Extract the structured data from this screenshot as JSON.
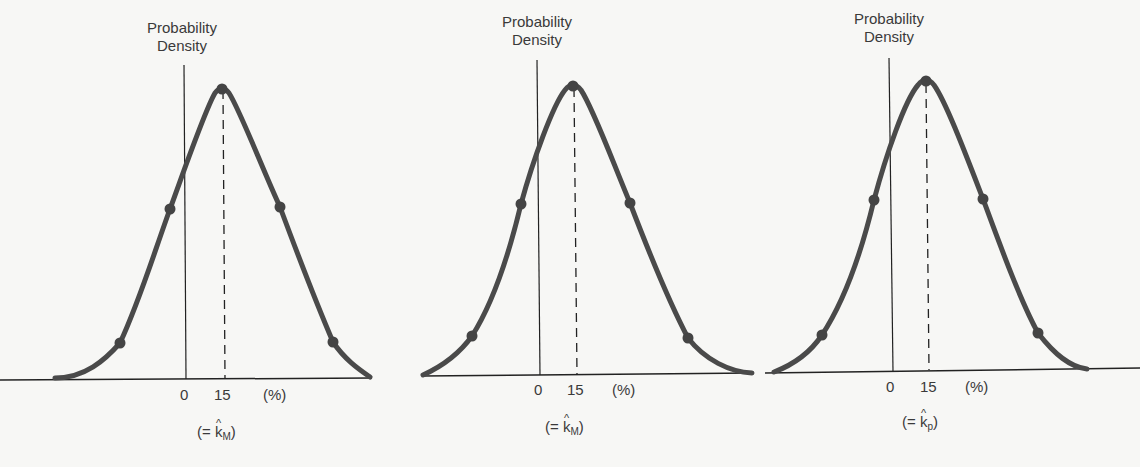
{
  "chart_data": [
    {
      "type": "line",
      "title": "",
      "ylabel": "Probability Density",
      "xlabel": "(%)",
      "x_ticks": [
        "0",
        "15"
      ],
      "x_unit": "(%)",
      "annotation": "(= k̂M)",
      "annotation_base": "(= ",
      "annotation_var": "k",
      "annotation_sub": "M",
      "annotation_end": ")",
      "distribution": "normal",
      "mean": 15,
      "marked_points": [
        "mean",
        "±1σ",
        "±2σ"
      ],
      "grid": false
    },
    {
      "type": "line",
      "title": "",
      "ylabel": "Probability Density",
      "xlabel": "(%)",
      "x_ticks": [
        "0",
        "15"
      ],
      "x_unit": "(%)",
      "annotation": "(= k̂M)",
      "annotation_base": "(= ",
      "annotation_var": "k",
      "annotation_sub": "M",
      "annotation_end": ")",
      "distribution": "normal",
      "mean": 15,
      "marked_points": [
        "mean",
        "±1σ",
        "±2σ"
      ],
      "grid": false
    },
    {
      "type": "line",
      "title": "",
      "ylabel": "Probability Density",
      "xlabel": "(%)",
      "x_ticks": [
        "0",
        "15"
      ],
      "x_unit": "(%)",
      "annotation": "(= k̂p)",
      "annotation_base": "(= ",
      "annotation_var": "k",
      "annotation_sub": "p",
      "annotation_end": ")",
      "distribution": "normal",
      "mean": 15,
      "marked_points": [
        "mean",
        "±1σ",
        "±2σ"
      ],
      "grid": false
    }
  ],
  "colors": {
    "curve": "#4a4a4a",
    "axis": "#222222",
    "background": "#f7f7f5"
  }
}
